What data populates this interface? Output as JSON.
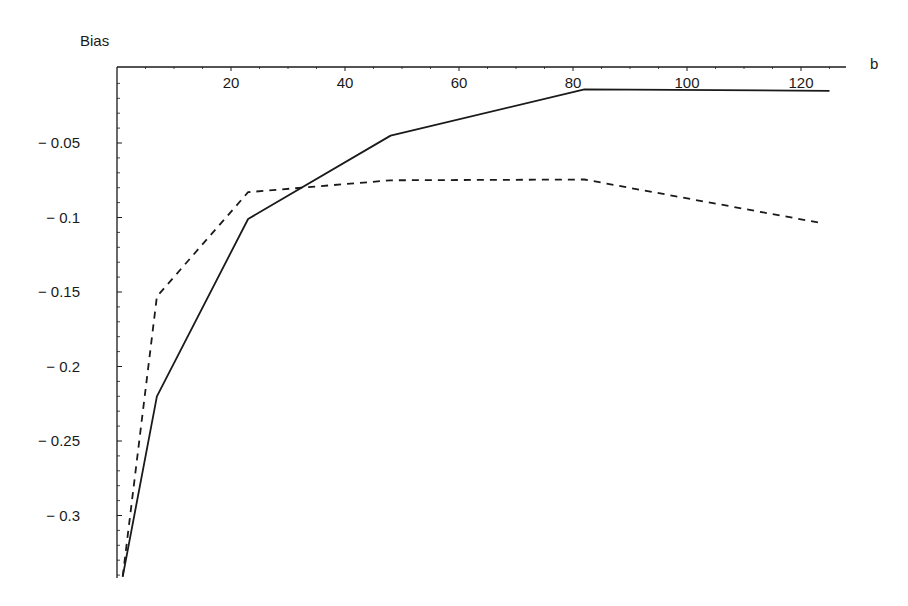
{
  "chart_data": {
    "type": "line",
    "title": "",
    "xlabel": "b",
    "ylabel": "Bias",
    "xlim": [
      0,
      130
    ],
    "ylim": [
      -0.341,
      0
    ],
    "grid": false,
    "legend": null,
    "x_ticks": [
      20,
      40,
      60,
      80,
      100,
      120
    ],
    "x_tick_labels": [
      "20",
      "40",
      "60",
      "80",
      "100",
      "120"
    ],
    "y_ticks": [
      -0.05,
      -0.1,
      -0.15,
      -0.2,
      -0.25,
      -0.3
    ],
    "y_tick_labels": [
      "− 0.05",
      "− 0.1",
      "− 0.15",
      "− 0.2",
      "− 0.25",
      "− 0.3"
    ],
    "series": [
      {
        "name": "solid",
        "style": "solid",
        "color": "#1a1a1a",
        "x": [
          1,
          7,
          23,
          48,
          82,
          125
        ],
        "y": [
          -0.341,
          -0.22,
          -0.101,
          -0.045,
          -0.014,
          -0.015
        ]
      },
      {
        "name": "dashed",
        "style": "dashed",
        "color": "#1a1a1a",
        "x": [
          1,
          7,
          23,
          48,
          82,
          124
        ],
        "y": [
          -0.341,
          -0.153,
          -0.083,
          -0.075,
          -0.0745,
          -0.104
        ]
      }
    ]
  }
}
